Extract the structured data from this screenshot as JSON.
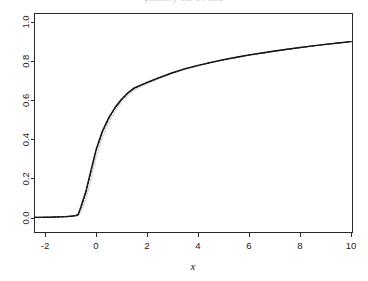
{
  "figure": {
    "title_clipped": "partially cut off title",
    "background_color": "#ffffff",
    "plot_box_color": "#2b2b2b"
  },
  "axes": {
    "x_title": "x",
    "y_title": "",
    "x_ticks": [
      "-2",
      "0",
      "2",
      "4",
      "6",
      "8",
      "10"
    ],
    "y_ticks": [
      "0.0",
      "0.2",
      "0.4",
      "0.6",
      "0.8",
      "1.0"
    ]
  },
  "chart_data": {
    "type": "line",
    "title": "",
    "xlabel": "x",
    "ylabel": "",
    "xlim": [
      -2.45,
      10.35
    ],
    "ylim": [
      -0.02,
      1.02
    ],
    "grid": false,
    "legend": "none",
    "x_ticks": [
      -2,
      0,
      2,
      4,
      6,
      8,
      10
    ],
    "y_ticks": [
      0.0,
      0.2,
      0.4,
      0.6,
      0.8,
      1.0
    ],
    "x": [
      -2.4,
      -2.2,
      -2.0,
      -1.8,
      -1.6,
      -1.4,
      -1.2,
      -1.0,
      -0.8,
      -0.7,
      -0.6,
      -0.4,
      -0.2,
      0.0,
      0.25,
      0.5,
      0.75,
      1.0,
      1.25,
      1.5,
      1.75,
      2.0,
      2.5,
      3.0,
      3.5,
      4.0,
      4.5,
      5.0,
      5.5,
      6.0,
      6.5,
      7.0,
      7.5,
      8.0,
      8.5,
      9.0,
      9.5,
      10.0
    ],
    "series": [
      {
        "name": "solid-curve",
        "style": "solid",
        "color": "#151515",
        "values": [
          0.003,
          0.003,
          0.004,
          0.004,
          0.005,
          0.006,
          0.007,
          0.009,
          0.012,
          0.018,
          0.055,
          0.135,
          0.243,
          0.348,
          0.444,
          0.512,
          0.565,
          0.606,
          0.639,
          0.664,
          0.678,
          0.692,
          0.718,
          0.742,
          0.762,
          0.779,
          0.794,
          0.808,
          0.82,
          0.832,
          0.842,
          0.852,
          0.861,
          0.87,
          0.878,
          0.886,
          0.893,
          0.9
        ]
      },
      {
        "name": "dashed-curve",
        "style": "dashed",
        "color": "#1d1d1d",
        "values": [
          0.003,
          0.003,
          0.004,
          0.004,
          0.005,
          0.006,
          0.007,
          0.009,
          0.012,
          0.016,
          0.048,
          0.126,
          0.234,
          0.341,
          0.438,
          0.507,
          0.561,
          0.603,
          0.636,
          0.661,
          0.676,
          0.69,
          0.716,
          0.74,
          0.761,
          0.778,
          0.793,
          0.807,
          0.819,
          0.831,
          0.841,
          0.851,
          0.861,
          0.869,
          0.878,
          0.886,
          0.893,
          0.9
        ]
      },
      {
        "name": "dotted-curve",
        "style": "dotted",
        "color": "#b8b8b8",
        "values": [
          0.003,
          0.003,
          0.003,
          0.004,
          0.004,
          0.005,
          0.006,
          0.007,
          0.009,
          0.011,
          0.028,
          0.092,
          0.196,
          0.308,
          0.412,
          0.487,
          0.545,
          0.59,
          0.625,
          0.652,
          0.668,
          0.684,
          0.712,
          0.737,
          0.758,
          0.776,
          0.791,
          0.805,
          0.818,
          0.83,
          0.84,
          0.85,
          0.86,
          0.869,
          0.877,
          0.885,
          0.893,
          0.9
        ]
      }
    ]
  }
}
